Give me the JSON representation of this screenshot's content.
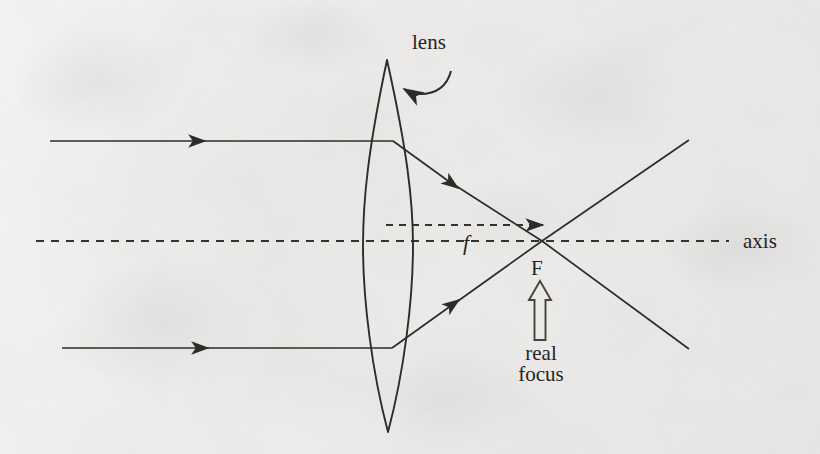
{
  "figure": {
    "kind": "ray-diagram",
    "background_color": "#f0efed",
    "ink_color": "#302e2c",
    "width": 820,
    "height": 454
  },
  "labels": {
    "lens": "lens",
    "axis": "axis",
    "focal_length": "f",
    "focal_point": "F",
    "focus_caption_line1": "real",
    "focus_caption_line2": "focus"
  },
  "geometry": {
    "axis_y": 241,
    "axis_dash_start_x": 36,
    "axis_dash_end_x": 729,
    "lens_center_x": 388,
    "lens_top_y": 60,
    "lens_bottom_y": 432,
    "lens_half_width": 25,
    "focus_x": 542,
    "focus_y": 241,
    "upper_ray_y": 141,
    "lower_ray_y": 348,
    "incoming_upper_start_x": 50,
    "incoming_lower_start_x": 62,
    "outgoing_end_x": 689,
    "outgoing_upper_end_y": 140,
    "outgoing_lower_end_y": 349,
    "f_arrow_y": 225
  },
  "elements": [
    {
      "name": "incoming-upper-ray",
      "type": "solid-arrow-line",
      "description": "parallel ray entering lens above axis"
    },
    {
      "name": "incoming-lower-ray",
      "type": "solid-arrow-line",
      "description": "parallel ray entering lens below axis"
    },
    {
      "name": "refracted-upper-ray",
      "type": "solid-arrow-line",
      "description": "converges down to focal point F"
    },
    {
      "name": "refracted-lower-ray",
      "type": "solid-arrow-line",
      "description": "converges up to focal point F"
    },
    {
      "name": "diverging-upper-ray",
      "type": "solid-line",
      "description": "continues past F upward to the right"
    },
    {
      "name": "diverging-lower-ray",
      "type": "solid-line",
      "description": "continues past F downward to the right"
    },
    {
      "name": "optical-axis",
      "type": "dashed-line"
    },
    {
      "name": "focal-length-arrow",
      "type": "dashed-arrow",
      "description": "from lens plane to F, labelled f"
    },
    {
      "name": "lens-outline",
      "type": "biconvex-lens"
    },
    {
      "name": "lens-callout-arrow",
      "type": "curved-arrow"
    },
    {
      "name": "focus-pointer-arrow",
      "type": "hollow-up-arrow"
    }
  ]
}
